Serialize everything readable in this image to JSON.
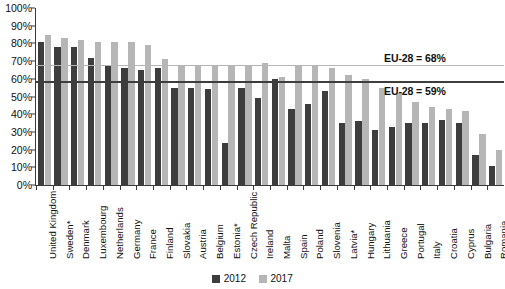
{
  "chart_data": {
    "type": "bar",
    "title": "",
    "subtitle": "",
    "xlabel": "",
    "ylabel": "",
    "ylim": [
      0,
      100
    ],
    "grid": false,
    "legend_position": "bottom-center",
    "y_ticks": [
      "0%",
      "10%",
      "20%",
      "30%",
      "40%",
      "50%",
      "60%",
      "70%",
      "80%",
      "90%",
      "100%"
    ],
    "y_tick_values": [
      0,
      10,
      20,
      30,
      40,
      50,
      60,
      70,
      80,
      90,
      100
    ],
    "categories": [
      "United Kingdom",
      "Sweden*",
      "Denmark",
      "Luxembourg",
      "Netherlands",
      "Germany",
      "France",
      "Finland",
      "Slovakia",
      "Austria",
      "Belgium",
      "Estonia*",
      "Czech Republic",
      "Ireland",
      "Malta",
      "Spain",
      "Poland",
      "Slovenia",
      "Latvia*",
      "Hungary",
      "Lithuania",
      "Greece",
      "Portugal",
      "Italy",
      "Croatia",
      "Cyprus",
      "Bulgaria",
      "Romania"
    ],
    "series": [
      {
        "name": "2012",
        "color": "#3d3d3d",
        "values": [
          81,
          78,
          78,
          72,
          67,
          66,
          65,
          66,
          55,
          55,
          54,
          24,
          55,
          49,
          60,
          43,
          46,
          53,
          35,
          36,
          31,
          33,
          35,
          35,
          37,
          35,
          17,
          11
        ]
      },
      {
        "name": "2017",
        "color": "#b6b6b6",
        "values": [
          85,
          83,
          82,
          81,
          81,
          81,
          79,
          71,
          67,
          68,
          67,
          67,
          68,
          69,
          61,
          68,
          68,
          66,
          62,
          60,
          55,
          52,
          47,
          44,
          43,
          42,
          29,
          20
        ]
      }
    ],
    "reference_lines": [
      {
        "name": "EU-28 = 68%",
        "value": 68,
        "series": "2017",
        "color": "#b6b6b6"
      },
      {
        "name": "EU-28 = 59%",
        "value": 59,
        "series": "2012",
        "color": "#3d3d3d"
      }
    ]
  },
  "legend": {
    "items": [
      {
        "label": "2012",
        "color": "#3d3d3d"
      },
      {
        "label": "2017",
        "color": "#b6b6b6"
      }
    ]
  },
  "colors": {
    "series_2012": "#3d3d3d",
    "series_2017": "#b6b6b6",
    "axis": "#3a3a3a",
    "text": "#101010",
    "background": "#ffffff"
  }
}
